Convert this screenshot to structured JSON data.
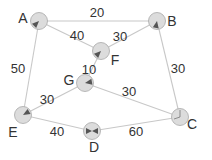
{
  "diagram": {
    "type": "weighted-graph",
    "colors": {
      "edge": "#c8c8c8",
      "node_fill": "#dcdcdc",
      "node_stroke": "#a8a8a8",
      "arrow": "#555555",
      "text": "#333333"
    },
    "nodes": [
      {
        "id": "A",
        "label": "A",
        "x": 39,
        "y": 21,
        "lx": 23,
        "ly": 23,
        "arrow_angle": 135
      },
      {
        "id": "B",
        "label": "B",
        "x": 157,
        "y": 21,
        "lx": 172,
        "ly": 26,
        "arrow_angle": 100
      },
      {
        "id": "C",
        "label": "C",
        "x": 180,
        "y": 117,
        "lx": 192,
        "ly": 129,
        "arrow_angle": -90
      },
      {
        "id": "D",
        "label": "D",
        "x": 92,
        "y": 131,
        "lx": 94,
        "ly": 152,
        "arrow_angle": 0
      },
      {
        "id": "E",
        "label": "E",
        "x": 23,
        "y": 115,
        "lx": 13,
        "ly": 137,
        "arrow_angle": -30
      },
      {
        "id": "F",
        "label": "F",
        "x": 101,
        "y": 51,
        "lx": 115,
        "ly": 65,
        "arrow_angle": 135
      },
      {
        "id": "G",
        "label": "G",
        "x": 85,
        "y": 83,
        "lx": 69,
        "ly": 85,
        "arrow_angle": -10
      }
    ],
    "edges": [
      {
        "from": "A",
        "to": "B",
        "weight": "20",
        "lx": 97,
        "ly": 17
      },
      {
        "from": "A",
        "to": "F",
        "weight": "40",
        "lx": 77,
        "ly": 40
      },
      {
        "from": "F",
        "to": "B",
        "weight": "30",
        "lx": 120,
        "ly": 41
      },
      {
        "from": "A",
        "to": "E",
        "weight": "50",
        "lx": 18,
        "ly": 73
      },
      {
        "from": "B",
        "to": "C",
        "weight": "30",
        "lx": 178,
        "ly": 73
      },
      {
        "from": "F",
        "to": "G",
        "weight": "10",
        "lx": 89,
        "ly": 74
      },
      {
        "from": "G",
        "to": "C",
        "weight": "30",
        "lx": 129,
        "ly": 96
      },
      {
        "from": "G",
        "to": "E",
        "weight": "30",
        "lx": 47,
        "ly": 104
      },
      {
        "from": "E",
        "to": "D",
        "weight": "40",
        "lx": 57,
        "ly": 136
      },
      {
        "from": "D",
        "to": "C",
        "weight": "60",
        "lx": 136,
        "ly": 136
      }
    ]
  }
}
